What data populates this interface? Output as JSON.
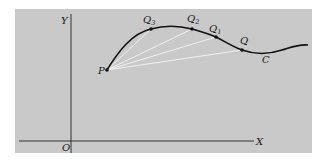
{
  "figure": {
    "panel_color": "#c9c9c9",
    "curve_color": "#111111",
    "chord_color": "#f4f4f4",
    "axis_color": "#222222",
    "axes": {
      "x_label": "X",
      "y_label": "Y",
      "origin_label": "O"
    },
    "curve": {
      "label": "C"
    },
    "points": {
      "P": {
        "label": "P",
        "sub": ""
      },
      "Q3": {
        "label": "Q",
        "sub": "3"
      },
      "Q2": {
        "label": "Q",
        "sub": "2"
      },
      "Q1": {
        "label": "Q",
        "sub": "1"
      },
      "Q": {
        "label": "Q",
        "sub": ""
      }
    }
  }
}
